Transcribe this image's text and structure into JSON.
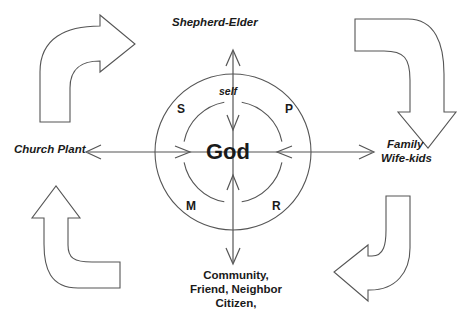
{
  "diagram": {
    "title_text": "Shepherd-Elder",
    "center_label": "God",
    "self_label": "self",
    "stroke_color": "#555555",
    "text_color": "#1a1a1a",
    "background_color": "#ffffff",
    "outer_labels": {
      "top": "Shepherd-Elder",
      "left": "Church Plant",
      "right_line1": "Family",
      "right_line2": "Wife-kids",
      "bottom_line1": "Community,",
      "bottom_line2": "Friend, Neighbor",
      "bottom_line3": "Citizen,"
    },
    "quadrants": [
      {
        "key": "S",
        "label": "S",
        "position": "upper-left"
      },
      {
        "key": "P",
        "label": "P",
        "position": "upper-right"
      },
      {
        "key": "M",
        "label": "M",
        "position": "lower-left"
      },
      {
        "key": "R",
        "label": "R",
        "position": "lower-right"
      }
    ],
    "circles": {
      "center_x": 233,
      "center_y": 152,
      "outer_radius": 78,
      "inner_radius": 50
    },
    "corner_arrows": [
      {
        "name": "top-left-arrow",
        "direction": "up-then-right"
      },
      {
        "name": "top-right-arrow",
        "direction": "right-then-down"
      },
      {
        "name": "bottom-left-arrow",
        "direction": "right-then-up"
      },
      {
        "name": "bottom-right-arrow",
        "direction": "down-then-left"
      }
    ],
    "axes": [
      {
        "name": "vertical-axis",
        "type": "double-headed"
      },
      {
        "name": "horizontal-axis",
        "type": "double-headed"
      }
    ]
  }
}
